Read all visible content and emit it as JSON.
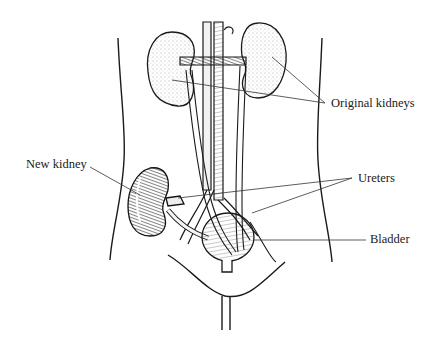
{
  "figure": {
    "type": "anatomical-illustration",
    "style": "black-and-white line drawing",
    "colors": {
      "ink": "#1a1a1a",
      "background": "#ffffff",
      "stipple": "#555555"
    }
  },
  "labels": {
    "original_kidneys": "Original kidneys",
    "new_kidney": "New kidney",
    "ureters": "Ureters",
    "bladder": "Bladder"
  }
}
